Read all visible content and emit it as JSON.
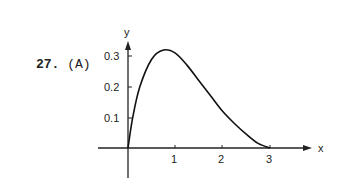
{
  "problem": {
    "number": "27.",
    "choice": "(A)"
  },
  "chart_data": {
    "type": "line",
    "title": "",
    "xlabel": "x",
    "ylabel": "y",
    "x_ticks": [
      "1",
      "2",
      "3"
    ],
    "y_ticks": [
      "0.1",
      "0.2",
      "0.3"
    ],
    "xlim": [
      -0.6,
      3.4
    ],
    "ylim": [
      -0.12,
      0.4
    ],
    "grid": false,
    "legend": null,
    "series": [
      {
        "name": "curve",
        "x": [
          0,
          0.1,
          0.25,
          0.5,
          0.75,
          1.0,
          1.25,
          1.5,
          1.75,
          2.0,
          2.25,
          2.5,
          2.75,
          3.0
        ],
        "y": [
          0,
          0.1,
          0.2,
          0.29,
          0.32,
          0.31,
          0.27,
          0.22,
          0.17,
          0.12,
          0.08,
          0.045,
          0.015,
          0
        ]
      }
    ]
  }
}
